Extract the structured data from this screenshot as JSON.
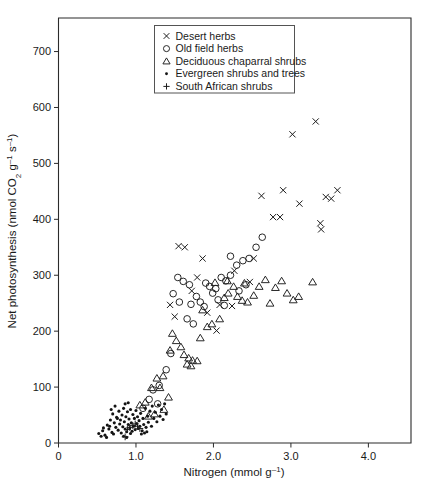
{
  "chart_data": {
    "type": "scatter",
    "title": "",
    "xlabel": "Nitrogen (mmol g⁻¹)",
    "ylabel": "Net photosynthesis (nmol CO₂ g⁻¹ s⁻¹)",
    "xlim": [
      0,
      4.55
    ],
    "ylim": [
      0,
      760
    ],
    "xticks": [
      0,
      1.0,
      2.0,
      3.0,
      4.0
    ],
    "xtick_labels": [
      "0",
      "1.0",
      "2.0",
      "3.0",
      "4.0"
    ],
    "yticks": [
      0,
      100,
      200,
      300,
      400,
      500,
      600,
      700
    ],
    "ytick_labels": [
      "0",
      "100",
      "200",
      "300",
      "400",
      "500",
      "600",
      "700"
    ],
    "grid": false,
    "legend_position": "top-center",
    "series": [
      {
        "name": "Desert herbs",
        "marker": "x",
        "points": [
          [
            1.55,
            352
          ],
          [
            1.63,
            350
          ],
          [
            1.86,
            330
          ],
          [
            1.79,
            296
          ],
          [
            2.27,
            308
          ],
          [
            2.24,
            245
          ],
          [
            2.08,
            247
          ],
          [
            1.92,
            233
          ],
          [
            2.62,
            442
          ],
          [
            2.77,
            404
          ],
          [
            2.86,
            404
          ],
          [
            2.9,
            452
          ],
          [
            3.02,
            552
          ],
          [
            3.32,
            575
          ],
          [
            3.11,
            428
          ],
          [
            3.38,
            393
          ],
          [
            3.45,
            440
          ],
          [
            3.52,
            437
          ],
          [
            3.6,
            452
          ],
          [
            3.39,
            382
          ],
          [
            1.72,
            272
          ],
          [
            2.47,
            288
          ],
          [
            2.52,
            330
          ],
          [
            2.04,
            201
          ],
          [
            1.44,
            247
          ],
          [
            1.5,
            226
          ]
        ]
      },
      {
        "name": "Old field herbs",
        "marker": "o",
        "points": [
          [
            1.54,
            296
          ],
          [
            1.61,
            289
          ],
          [
            1.69,
            283
          ],
          [
            1.9,
            286
          ],
          [
            1.95,
            280
          ],
          [
            2.03,
            276
          ],
          [
            1.99,
            268
          ],
          [
            2.1,
            296
          ],
          [
            2.16,
            290
          ],
          [
            2.22,
            300
          ],
          [
            2.3,
            318
          ],
          [
            2.38,
            326
          ],
          [
            2.46,
            330
          ],
          [
            2.55,
            350
          ],
          [
            2.63,
            368
          ],
          [
            2.22,
            334
          ],
          [
            1.78,
            262
          ],
          [
            1.83,
            252
          ],
          [
            1.71,
            248
          ],
          [
            1.88,
            244
          ],
          [
            2.06,
            256
          ],
          [
            2.14,
            246
          ],
          [
            1.48,
            267
          ],
          [
            1.56,
            252
          ],
          [
            2.33,
            272
          ],
          [
            2.42,
            283
          ],
          [
            1.66,
            222
          ],
          [
            1.74,
            213
          ],
          [
            1.22,
            95
          ],
          [
            1.17,
            78
          ],
          [
            1.09,
            62
          ],
          [
            1.3,
            103
          ],
          [
            1.39,
            131
          ],
          [
            1.45,
            160
          ],
          [
            1.28,
            70
          ]
        ]
      },
      {
        "name": "Deciduous chaparral shrubs",
        "marker": "triangle",
        "points": [
          [
            1.47,
            196
          ],
          [
            1.52,
            183
          ],
          [
            1.58,
            172
          ],
          [
            1.44,
            166
          ],
          [
            1.62,
            158
          ],
          [
            1.68,
            152
          ],
          [
            1.73,
            148
          ],
          [
            1.79,
            147
          ],
          [
            1.66,
            141
          ],
          [
            1.71,
            138
          ],
          [
            1.83,
            188
          ],
          [
            1.98,
            213
          ],
          [
            2.08,
            222
          ],
          [
            2.14,
            260
          ],
          [
            2.19,
            268
          ],
          [
            2.26,
            280
          ],
          [
            2.31,
            262
          ],
          [
            2.37,
            255
          ],
          [
            2.44,
            252
          ],
          [
            2.52,
            264
          ],
          [
            2.59,
            280
          ],
          [
            2.67,
            292
          ],
          [
            2.73,
            250
          ],
          [
            2.8,
            278
          ],
          [
            2.88,
            290
          ],
          [
            2.95,
            268
          ],
          [
            3.03,
            256
          ],
          [
            3.1,
            262
          ],
          [
            3.28,
            288
          ],
          [
            2.4,
            286
          ],
          [
            2.18,
            290
          ],
          [
            2.02,
            287
          ],
          [
            1.35,
            120
          ],
          [
            1.27,
            116
          ],
          [
            1.2,
            99
          ],
          [
            1.31,
            99
          ],
          [
            1.12,
            73
          ],
          [
            1.05,
            68
          ],
          [
            1.42,
            82
          ],
          [
            1.36,
            60
          ],
          [
            1.24,
            52
          ],
          [
            1.16,
            48
          ],
          [
            1.86,
            238
          ],
          [
            1.92,
            208
          ]
        ]
      },
      {
        "name": "Evergreen shrubs and trees",
        "marker": "dot",
        "points": [
          [
            0.52,
            17
          ],
          [
            0.57,
            22
          ],
          [
            0.6,
            14
          ],
          [
            0.63,
            32
          ],
          [
            0.65,
            25
          ],
          [
            0.67,
            41
          ],
          [
            0.69,
            19
          ],
          [
            0.7,
            52
          ],
          [
            0.72,
            36
          ],
          [
            0.74,
            28
          ],
          [
            0.75,
            46
          ],
          [
            0.77,
            23
          ],
          [
            0.78,
            57
          ],
          [
            0.79,
            34
          ],
          [
            0.8,
            41
          ],
          [
            0.81,
            18
          ],
          [
            0.82,
            50
          ],
          [
            0.83,
            29
          ],
          [
            0.84,
            62
          ],
          [
            0.85,
            38
          ],
          [
            0.86,
            25
          ],
          [
            0.87,
            47
          ],
          [
            0.88,
            20
          ],
          [
            0.89,
            56
          ],
          [
            0.9,
            33
          ],
          [
            0.91,
            43
          ],
          [
            0.92,
            27
          ],
          [
            0.93,
            60
          ],
          [
            0.94,
            36
          ],
          [
            0.95,
            21
          ],
          [
            0.96,
            51
          ],
          [
            0.97,
            30
          ],
          [
            0.98,
            44
          ],
          [
            0.99,
            24
          ],
          [
            1.0,
            58
          ],
          [
            1.01,
            35
          ],
          [
            1.02,
            47
          ],
          [
            1.03,
            26
          ],
          [
            1.04,
            40
          ],
          [
            1.05,
            30
          ],
          [
            1.06,
            53
          ],
          [
            1.08,
            22
          ],
          [
            1.09,
            44
          ],
          [
            1.1,
            33
          ],
          [
            1.12,
            62
          ],
          [
            1.13,
            28
          ],
          [
            1.15,
            48
          ],
          [
            1.16,
            37
          ],
          [
            1.18,
            57
          ],
          [
            1.2,
            30
          ],
          [
            1.21,
            66
          ],
          [
            1.23,
            44
          ],
          [
            1.25,
            55
          ],
          [
            1.27,
            38
          ],
          [
            1.29,
            68
          ],
          [
            1.31,
            48
          ],
          [
            1.33,
            60
          ],
          [
            1.35,
            42
          ],
          [
            1.37,
            70
          ],
          [
            1.39,
            52
          ],
          [
            0.55,
            12
          ],
          [
            0.58,
            27
          ],
          [
            0.62,
            10
          ],
          [
            0.66,
            30
          ],
          [
            0.71,
            16
          ],
          [
            0.76,
            44
          ],
          [
            0.86,
            70
          ],
          [
            0.9,
            72
          ],
          [
            0.93,
            17
          ],
          [
            1.07,
            16
          ],
          [
            1.11,
            18
          ],
          [
            1.14,
            20
          ],
          [
            0.68,
            60
          ],
          [
            0.73,
            66
          ],
          [
            0.84,
            12
          ],
          [
            0.88,
            10
          ]
        ]
      },
      {
        "name": "South African shrubs",
        "marker": "plus",
        "points": [
          [
            0.86,
            11
          ],
          [
            0.96,
            31
          ],
          [
            0.99,
            34
          ],
          [
            1.02,
            30
          ],
          [
            0.92,
            28
          ],
          [
            1.05,
            26
          ],
          [
            0.89,
            24
          ]
        ]
      }
    ]
  },
  "legend": {
    "items": [
      {
        "marker": "x",
        "label": "Desert herbs"
      },
      {
        "marker": "o",
        "label": "Old field herbs"
      },
      {
        "marker": "triangle",
        "label": "Deciduous chaparral shrubs"
      },
      {
        "marker": "dot",
        "label": "Evergreen shrubs and trees"
      },
      {
        "marker": "plus",
        "label": "South African shrubs"
      }
    ]
  },
  "colors": {
    "marker": "#1c1c1c",
    "axis": "#2b2b2b",
    "background": "#ffffff"
  }
}
